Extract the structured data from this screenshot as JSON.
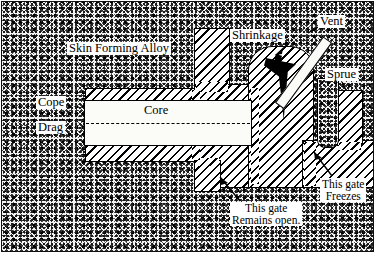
{
  "figure": {
    "type": "engineering-cross-section",
    "frame": {
      "border_color": "#111111"
    },
    "colors": {
      "sand_stipple": "#1a1a1a",
      "metal_hatch": "#000000",
      "metal_fill": "#ffffff",
      "cavity_fill": "#000000",
      "core_fill": "#fbfbf8",
      "outline": "#000000"
    }
  },
  "labels": {
    "skin_forming_alloy": "Skin Forming Alloy",
    "cope": "Cope",
    "drag": "Drag",
    "core": "Core",
    "shrinkage": "Shrinkage",
    "vent": "Vent",
    "sprue": "Sprue",
    "gate_open_line1": "This gate",
    "gate_open_line2": "Remains open.",
    "gate_freeze_line1": "This gate",
    "gate_freeze_line2": "Freezes"
  },
  "regions": {
    "mould_sand": "stippled sand mould surrounding the casting",
    "casting_body": "cross-hatched solidified metal casting",
    "core": "white horizontal core bar with dash-dot centerline",
    "shrinkage_cavity": "black inverted funnel void at top of riser",
    "vent_channel": "white diagonal channel from cavity to upper right",
    "sprue_channel": "hatched vertical sprue column at right",
    "parting_line": "horizontal cope / drag parting line"
  }
}
